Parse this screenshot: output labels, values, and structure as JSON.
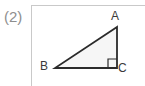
{
  "figure": {
    "item_number": "(2)",
    "type": "right-triangle-diagram",
    "background_color": "#ffffff",
    "panel": {
      "border_color": "#c9c9c9",
      "fill_color": "#ffffff"
    },
    "triangle": {
      "stroke_color": "#2b2b2b",
      "fill_color": "#f6f6f6",
      "vertices": [
        {
          "name": "A",
          "label": "A",
          "x": 117,
          "y": 27
        },
        {
          "name": "B",
          "label": "B",
          "x": 55,
          "y": 68
        },
        {
          "name": "C",
          "label": "C",
          "x": 117,
          "y": 68
        }
      ],
      "right_angle_at": "C",
      "right_angle_marker": {
        "shown": true,
        "size": 9,
        "stroke_color": "#2b2b2b"
      }
    },
    "labels": {
      "A": "A",
      "B": "B",
      "C": "C"
    }
  }
}
